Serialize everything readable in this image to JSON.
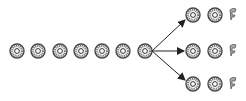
{
  "diagram": {
    "colors": {
      "background": "#ffffff",
      "disc": "#555555",
      "arrow": "#222222"
    },
    "main_chain": {
      "count": 7,
      "centers_x": [
        17,
        38,
        60,
        81,
        102,
        123,
        145
      ],
      "y": 51
    },
    "branches": [
      {
        "name": "top",
        "y": 15,
        "discs_x": [
          193,
          215
        ],
        "partial_x": 233,
        "arrow_to": [
          185,
          20
        ]
      },
      {
        "name": "middle",
        "y": 51,
        "discs_x": [
          193,
          215
        ],
        "partial_x": 233,
        "arrow_to": [
          184,
          51
        ]
      },
      {
        "name": "bottom",
        "y": 84,
        "discs_x": [
          193,
          215
        ],
        "partial_x": 233,
        "arrow_to": [
          185,
          80
        ]
      }
    ],
    "branch_origin": [
      152,
      51
    ],
    "disc_radius": 7
  }
}
